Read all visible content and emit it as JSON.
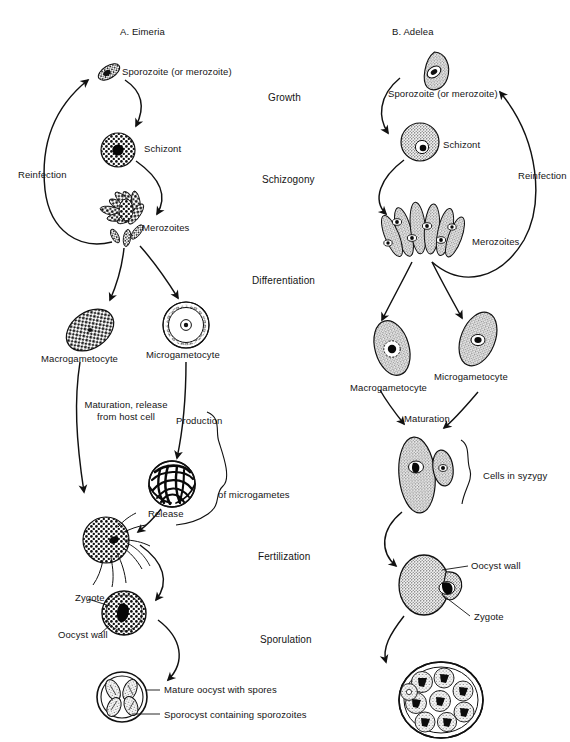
{
  "figure": {
    "background": "#ffffff",
    "ink": "#111111",
    "width": 570,
    "height": 742
  },
  "panels": [
    {
      "id": "A",
      "prefix": "A.",
      "genus": "Eimeria"
    },
    {
      "id": "B",
      "prefix": "B.",
      "genus": "Adelea"
    }
  ],
  "center_stages": [
    {
      "label": "Growth",
      "x": 268,
      "y": 92
    },
    {
      "label": "Schizogony",
      "x": 262,
      "y": 174
    },
    {
      "label": "Differentiation",
      "x": 252,
      "y": 275
    },
    {
      "label": "Fertilization",
      "x": 258,
      "y": 551
    },
    {
      "label": "Sporulation",
      "x": 260,
      "y": 634
    }
  ],
  "panel_a": {
    "title_prefix": "A.",
    "title_genus": "Eimeria",
    "labels": [
      {
        "name": "sporozoite",
        "text": "Sporozoite (or merozoite)",
        "x": 122,
        "y": 72
      },
      {
        "name": "schizont",
        "text": "Schizont",
        "x": 144,
        "y": 143
      },
      {
        "name": "reinfection",
        "text": "Reinfection",
        "x": 18,
        "y": 169
      },
      {
        "name": "merozoites",
        "text": "Merozoites",
        "x": 142,
        "y": 222
      },
      {
        "name": "macrogametocyte",
        "text": "Macrogametocyte",
        "x": 41,
        "y": 353
      },
      {
        "name": "microgametocyte",
        "text": "Microgametocyte",
        "x": 146,
        "y": 349
      },
      {
        "name": "maturation",
        "text": "Maturation, release\nfrom host cell",
        "x": 80,
        "y": 400
      },
      {
        "name": "production",
        "text": "Production",
        "x": 176,
        "y": 415
      },
      {
        "name": "of-microgametes",
        "text": "of microgametes",
        "x": 218,
        "y": 489
      },
      {
        "name": "release",
        "text": "Release",
        "x": 148,
        "y": 508
      },
      {
        "name": "zygote",
        "text": "Zygote",
        "x": 75,
        "y": 598
      },
      {
        "name": "oocyst-wall",
        "text": "Oocyst wall",
        "x": 58,
        "y": 633
      },
      {
        "name": "mature-oocyst",
        "text": "Mature oocyst with spores",
        "x": 164,
        "y": 689
      },
      {
        "name": "sporocyst",
        "text": "Sporocyst containing sporozoites",
        "x": 164,
        "y": 714
      }
    ]
  },
  "panel_b": {
    "title_prefix": "B.",
    "title_genus": "Adelea",
    "labels": [
      {
        "name": "sporozoite",
        "text": "Sporozoite (or merozoite)",
        "x": 388,
        "y": 88
      },
      {
        "name": "schizont",
        "text": "Schizont",
        "x": 443,
        "y": 139
      },
      {
        "name": "reinfection",
        "text": "Reinfection",
        "x": 518,
        "y": 170
      },
      {
        "name": "merozoites",
        "text": "Merozoites",
        "x": 472,
        "y": 236
      },
      {
        "name": "macrogametocyte",
        "text": "Macrogametocyte",
        "x": 368,
        "y": 384
      },
      {
        "name": "microgametocyte",
        "text": "Microgametocyte",
        "x": 448,
        "y": 373
      },
      {
        "name": "maturation",
        "text": "Maturation",
        "x": 404,
        "y": 415
      },
      {
        "name": "cells-in-syzygy",
        "text": "Cells in syzygy",
        "x": 483,
        "y": 478
      },
      {
        "name": "oocyst-wall",
        "text": "Oocyst wall",
        "x": 474,
        "y": 570
      },
      {
        "name": "zygote",
        "text": "Zygote",
        "x": 477,
        "y": 618
      }
    ]
  },
  "cell_icons": [
    {
      "name": "sporozoite-cell-a",
      "kind": "spindle-stipple",
      "panel": "A"
    },
    {
      "name": "schizont-cell-a",
      "kind": "round-stipple-dark-nucleus",
      "panel": "A"
    },
    {
      "name": "merozoites-cluster-a",
      "kind": "rosette",
      "panel": "A"
    },
    {
      "name": "macrogametocyte-cell-a",
      "kind": "oval-coarse-stipple",
      "panel": "A"
    },
    {
      "name": "microgametocyte-cell-a",
      "kind": "ring-of-dots",
      "panel": "A"
    },
    {
      "name": "microgamete-mass-a",
      "kind": "tangled-flagella-ball",
      "panel": "A"
    },
    {
      "name": "fertilization-cell-a",
      "kind": "stippled-round-with-flagella",
      "panel": "A"
    },
    {
      "name": "zygote-oocyst-a",
      "kind": "stippled-round-dark-center",
      "panel": "A"
    },
    {
      "name": "mature-oocyst-a",
      "kind": "double-walled-with-sporocysts",
      "panel": "A"
    },
    {
      "name": "sporozoite-cell-b",
      "kind": "teardrop-stipple",
      "panel": "B"
    },
    {
      "name": "schizont-cell-b",
      "kind": "round-stipple-small-nucleus",
      "panel": "B"
    },
    {
      "name": "merozoites-cluster-b",
      "kind": "bundle-of-elongate-cells",
      "panel": "B"
    },
    {
      "name": "macrogametocyte-cell-b",
      "kind": "ellipse-stipple-nucleus",
      "panel": "B"
    },
    {
      "name": "microgametocyte-cell-b",
      "kind": "ellipse-stipple-nucleus",
      "panel": "B"
    },
    {
      "name": "syzygy-pair-b",
      "kind": "large-plus-small-attached",
      "panel": "B"
    },
    {
      "name": "zygote-oocyst-b",
      "kind": "ellipse-with-bud-dark-center",
      "panel": "B"
    },
    {
      "name": "mature-oocyst-b",
      "kind": "round-many-sporocysts",
      "panel": "B"
    }
  ]
}
